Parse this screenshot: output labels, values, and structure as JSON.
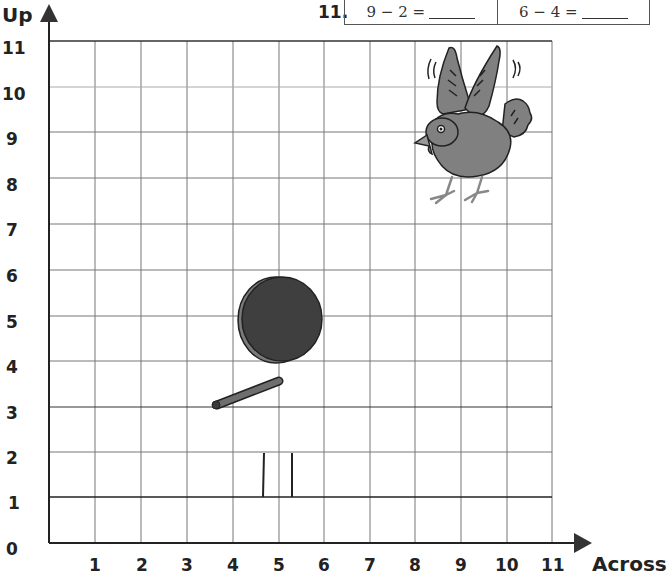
{
  "problem": {
    "number": "11.",
    "items": [
      {
        "expression": "9 − 2 =",
        "answer": ""
      },
      {
        "expression": "6 − 4 =",
        "answer": ""
      }
    ]
  },
  "grid": {
    "y_axis_title": "Up",
    "x_axis_title": "Across",
    "x_ticks": [
      "1",
      "2",
      "3",
      "4",
      "5",
      "6",
      "7",
      "8",
      "9",
      "10",
      "11"
    ],
    "y_ticks": [
      "0",
      "1",
      "2",
      "3",
      "4",
      "5",
      "6",
      "7",
      "8",
      "9",
      "10",
      "11"
    ],
    "colors": {
      "grid_line": "#666666",
      "axis": "#222222",
      "disc": "#3f3f3f",
      "disc_rim": "#7a7a7a",
      "bird": "#808080"
    }
  },
  "pictures": [
    {
      "name": "bird",
      "position": "about (8.5, 9)"
    },
    {
      "name": "disc",
      "position": "about (5, 5)"
    },
    {
      "name": "stick",
      "position": "from about (3.5, 3) to (5, 3.5)"
    },
    {
      "name": "posts",
      "position": "at about x 4.6 and 5.3, y 1 to 2"
    }
  ]
}
